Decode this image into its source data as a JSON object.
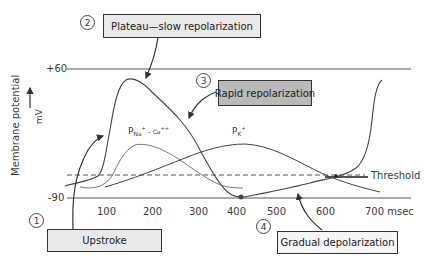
{
  "diagram": {
    "type": "cardiac-pacemaker-action-potential",
    "y_axis": {
      "label": "Membrane potential",
      "unit": "mV",
      "ticks": [
        "+60",
        "-90"
      ]
    },
    "x_axis": {
      "ticks": [
        "100",
        "200",
        "300",
        "400",
        "500",
        "600",
        "700 msec"
      ],
      "unit": "msec"
    },
    "threshold_label": "Threshold",
    "curve_labels": {
      "p_na_ca": {
        "base": "P",
        "sub": "Na",
        "sup1": "+",
        "mid": " – Ca",
        "sup2": "++"
      },
      "p_k": {
        "base": "P",
        "sub": "K",
        "sup": "+"
      }
    },
    "phases": [
      {
        "number": "1",
        "label": "Upstroke"
      },
      {
        "number": "2",
        "label": "Plateau—slow repolarization"
      },
      {
        "number": "3",
        "label": "Rapid repolarization"
      },
      {
        "number": "4",
        "label": "Gradual depolarization"
      }
    ],
    "colors": {
      "axis": "#555555",
      "curve": "#444444",
      "box_light": "#e9e9e9",
      "box_dark": "#b9b9b9"
    }
  }
}
